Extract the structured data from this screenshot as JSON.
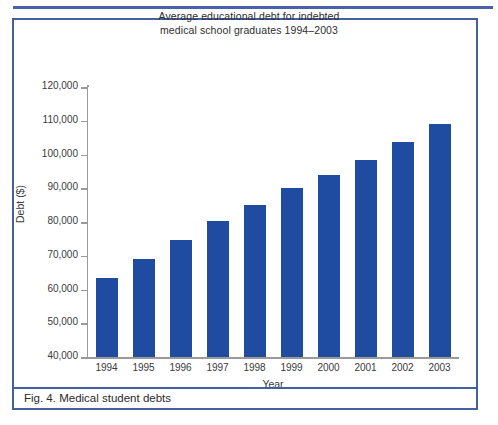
{
  "figure": {
    "caption": "Fig. 4. Medical student debts",
    "border_color": "#44609f",
    "rule_color": "#4a63a8"
  },
  "chart_data": {
    "type": "bar",
    "title": "Average educational debt for indebted medical school graduates 1994–2003",
    "title_line1": "Average educational debt for indebted",
    "title_line2": "medical school graduates 1994–2003",
    "xlabel": "Year",
    "ylabel": "Debt ($)",
    "ylim": [
      40000,
      120000
    ],
    "ytick_step": 10000,
    "ytick_labels": [
      "120,000",
      "110,000",
      "100,000",
      "90,000",
      "80,000",
      "70,000",
      "60,000",
      "50,000",
      "40,000"
    ],
    "yticks": [
      120000,
      110000,
      100000,
      90000,
      80000,
      70000,
      60000,
      50000,
      40000
    ],
    "grid": false,
    "legend": false,
    "bar_color": "#1f4ca0",
    "categories": [
      "1994",
      "1995",
      "1996",
      "1997",
      "1998",
      "1999",
      "2000",
      "2001",
      "2002",
      "2003"
    ],
    "values": [
      63500,
      69000,
      74800,
      80300,
      85000,
      90200,
      94000,
      98500,
      103800,
      109000
    ]
  }
}
